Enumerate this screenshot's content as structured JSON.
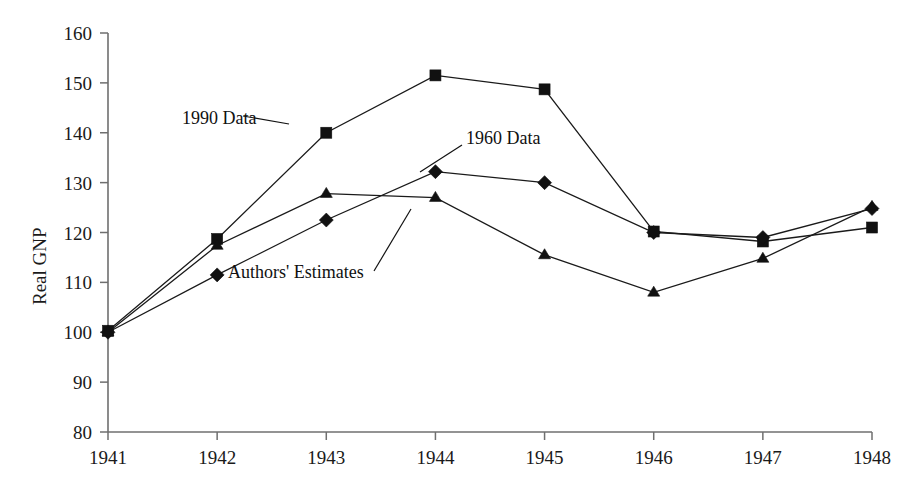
{
  "figure": {
    "background_color": "#ffffff",
    "ink_color": "#111111",
    "axis_color": "#6f6f6f"
  },
  "chart_data": {
    "type": "line",
    "title": "",
    "subtitle": "",
    "xlabel": "",
    "ylabel": "Real GNP",
    "x": [
      1941,
      1942,
      1943,
      1944,
      1945,
      1946,
      1947,
      1948
    ],
    "categories": [
      "1941",
      "1942",
      "1943",
      "1944",
      "1945",
      "1946",
      "1947",
      "1948"
    ],
    "xlim": [
      1941,
      1948
    ],
    "ylim": [
      80,
      160
    ],
    "ytick_labels": [
      "80",
      "90",
      "100",
      "110",
      "120",
      "130",
      "140",
      "150",
      "160"
    ],
    "yticks": [
      80,
      90,
      100,
      110,
      120,
      130,
      140,
      150,
      160
    ],
    "grid": false,
    "legend_position": "inline-annotations",
    "series": [
      {
        "name": "1990 Data",
        "marker": "square",
        "values": [
          100.3,
          118.7,
          140.0,
          151.5,
          148.7,
          120.2,
          118.2,
          121.0
        ]
      },
      {
        "name": "1960 Data",
        "marker": "diamond",
        "values": [
          100.0,
          111.5,
          122.5,
          132.2,
          130.0,
          120.0,
          119.0,
          124.8
        ]
      },
      {
        "name": "Authors' Estimates",
        "marker": "triangle",
        "values": [
          100.0,
          117.4,
          127.8,
          127.0,
          115.5,
          108.0,
          114.8,
          125.2
        ]
      }
    ],
    "annotations": [
      {
        "text": "1990 Data",
        "series": "1990 Data",
        "anchor_x": 1943
      },
      {
        "text": "1960 Data",
        "series": "1960 Data",
        "anchor_x": 1944
      },
      {
        "text": "Authors' Estimates",
        "series": "Authors' Estimates",
        "anchor_x": 1944
      }
    ]
  }
}
